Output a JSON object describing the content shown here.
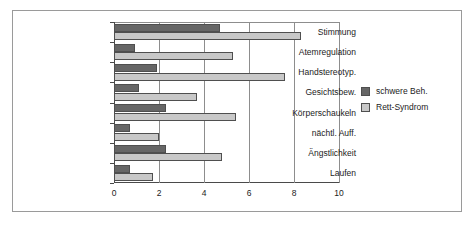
{
  "chart_data": {
    "type": "bar",
    "orientation": "horizontal",
    "title": "",
    "xlabel": "",
    "ylabel": "",
    "xlim": [
      0,
      10
    ],
    "xticks": [
      "0",
      "2",
      "4",
      "6",
      "8",
      "10"
    ],
    "grid": true,
    "legend_position": "right",
    "categories": [
      "Stimmung",
      "Atemregulation",
      "Handstereotyp.",
      "Gesichtsbew.",
      "Körperschaukeln",
      "nächtl. Auff.",
      "Ängstlichkeit",
      "Laufen"
    ],
    "series": [
      {
        "name": "schwere Beh.",
        "color": "#666666",
        "values": [
          4.7,
          0.95,
          1.9,
          1.1,
          2.3,
          0.7,
          2.3,
          0.7
        ]
      },
      {
        "name": "Rett-Syndrom",
        "color": "#c8c8c8",
        "values": [
          8.3,
          5.3,
          7.6,
          3.7,
          5.4,
          2.0,
          4.8,
          1.75
        ]
      }
    ]
  },
  "legend": {
    "items": [
      {
        "label": "schwere Beh.",
        "swatch": "dark"
      },
      {
        "label": "Rett-Syndrom",
        "swatch": "light"
      }
    ]
  }
}
